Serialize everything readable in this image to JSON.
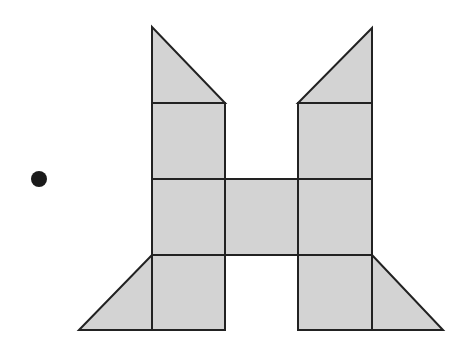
{
  "figure": {
    "fill_color": "#d3d3d3",
    "stroke_color": "#222222",
    "dot": {
      "cx": 39,
      "cy": 179,
      "r": 8,
      "color": "#1a1a1a"
    },
    "squares": [
      {
        "name": "square-left-top",
        "x": 152,
        "y": 103,
        "w": 73,
        "h": 76
      },
      {
        "name": "square-left-middle",
        "x": 152,
        "y": 179,
        "w": 73,
        "h": 76
      },
      {
        "name": "square-left-bottom",
        "x": 152,
        "y": 255,
        "w": 73,
        "h": 75
      },
      {
        "name": "square-center",
        "x": 225,
        "y": 179,
        "w": 73,
        "h": 76
      },
      {
        "name": "square-right-top",
        "x": 298,
        "y": 103,
        "w": 74,
        "h": 76
      },
      {
        "name": "square-right-middle",
        "x": 298,
        "y": 179,
        "w": 74,
        "h": 76
      },
      {
        "name": "square-right-bottom",
        "x": 298,
        "y": 255,
        "w": 74,
        "h": 75
      }
    ],
    "triangles": [
      {
        "name": "triangle-top-left",
        "points": "152,27 152,103 225,103"
      },
      {
        "name": "triangle-top-right",
        "points": "372,28 372,103 298,103"
      },
      {
        "name": "triangle-bottom-left",
        "points": "79,330 152,255 152,330"
      },
      {
        "name": "triangle-bottom-right",
        "points": "372,255 443,330 372,330"
      }
    ]
  }
}
